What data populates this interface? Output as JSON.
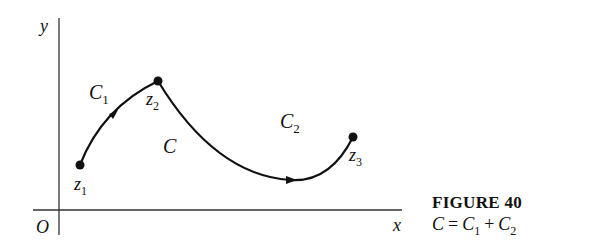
{
  "figure": {
    "title": "FIGURE 40",
    "equation": {
      "lhs": "C",
      "eq": "=",
      "t1": "C",
      "t1_sub": "1",
      "plus": "+",
      "t2": "C",
      "t2_sub": "2"
    }
  },
  "axes": {
    "origin_label": "O",
    "x_label": "x",
    "y_label": "y"
  },
  "points": [
    {
      "name": "z",
      "sub": "1",
      "x": 80,
      "y": 165
    },
    {
      "name": "z",
      "sub": "2",
      "x": 158,
      "y": 81
    },
    {
      "name": "z",
      "sub": "3",
      "x": 353,
      "y": 137
    }
  ],
  "curves": {
    "c1": {
      "label": "C",
      "sub": "1"
    },
    "c2": {
      "label": "C",
      "sub": "2"
    },
    "c": {
      "label": "C"
    }
  },
  "colors": {
    "ink": "#111111",
    "axis": "#333333"
  }
}
